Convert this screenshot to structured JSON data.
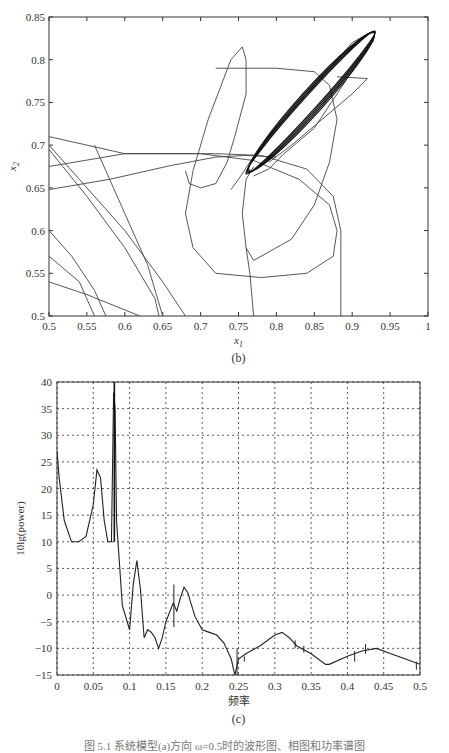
{
  "chart_data": [
    {
      "type": "line",
      "panel": "(b)",
      "title": "",
      "xlabel": "x1",
      "ylabel": "x2",
      "xlim": [
        0.5,
        1
      ],
      "ylim": [
        0.5,
        0.85
      ],
      "xticks": [
        "0.5",
        "0.55",
        "0.6",
        "0.65",
        "0.7",
        "0.75",
        "0.8",
        "0.85",
        "0.9",
        "0.95",
        "1"
      ],
      "yticks": [
        "0.5",
        "0.55",
        "0.6",
        "0.65",
        "0.7",
        "0.75",
        "0.8",
        "0.85"
      ],
      "grid": false,
      "description": "phase-plane trajectory converging to an elongated limit cycle from (0.76,0.67) to (0.93,0.83)",
      "series": [
        {
          "name": "limit-cycle",
          "x": [
            0.76,
            0.78,
            0.82,
            0.86,
            0.9,
            0.925,
            0.93,
            0.92,
            0.89,
            0.85,
            0.8,
            0.77,
            0.76
          ],
          "y": [
            0.665,
            0.69,
            0.73,
            0.77,
            0.81,
            0.83,
            0.832,
            0.815,
            0.78,
            0.74,
            0.7,
            0.67,
            0.665
          ]
        },
        {
          "name": "transient-1",
          "x": [
            0.5,
            0.6,
            0.7,
            0.78,
            0.86,
            0.89,
            0.885,
            0.885
          ],
          "y": [
            0.71,
            0.69,
            0.69,
            0.688,
            0.66,
            0.62,
            0.56,
            0.5
          ]
        },
        {
          "name": "transient-2",
          "x": [
            0.5,
            0.65,
            0.74,
            0.8,
            0.87,
            0.89,
            0.87,
            0.8,
            0.72,
            0.68,
            0.69,
            0.73,
            0.76
          ],
          "y": [
            0.648,
            0.672,
            0.686,
            0.79,
            0.79,
            0.73,
            0.64,
            0.57,
            0.548,
            0.6,
            0.7,
            0.8,
            0.815
          ]
        }
      ]
    },
    {
      "type": "line",
      "panel": "(c)",
      "title": "",
      "xlabel": "频率",
      "ylabel": "10lg(power)",
      "xlim": [
        0,
        0.5
      ],
      "ylim": [
        -15,
        40
      ],
      "xticks": [
        "0",
        "0.05",
        "0.1",
        "0.15",
        "0.2",
        "0.25",
        "0.3",
        "0.35",
        "0.4",
        "0.45",
        "0.5"
      ],
      "yticks": [
        "-15",
        "-10",
        "-5",
        "0",
        "5",
        "10",
        "15",
        "20",
        "25",
        "30",
        "35",
        "40"
      ],
      "grid": true,
      "x": [
        0,
        0.003,
        0.01,
        0.02,
        0.03,
        0.04,
        0.05,
        0.055,
        0.06,
        0.065,
        0.07,
        0.075,
        0.078,
        0.08,
        0.082,
        0.085,
        0.09,
        0.1,
        0.105,
        0.11,
        0.115,
        0.12,
        0.125,
        0.13,
        0.135,
        0.14,
        0.145,
        0.15,
        0.16,
        0.165,
        0.17,
        0.175,
        0.18,
        0.19,
        0.2,
        0.21,
        0.22,
        0.23,
        0.24,
        0.245,
        0.25,
        0.26,
        0.28,
        0.3,
        0.31,
        0.32,
        0.33,
        0.35,
        0.37,
        0.375,
        0.4,
        0.42,
        0.44,
        0.46,
        0.48,
        0.5
      ],
      "values": [
        27,
        22,
        14,
        10,
        10,
        11,
        17,
        23.5,
        22,
        14,
        10,
        10,
        38,
        35,
        14,
        8,
        -2,
        -6.5,
        2,
        6.5,
        1,
        -8,
        -6.5,
        -7,
        -8,
        -10,
        -8,
        -5,
        -1.5,
        -3,
        -0.5,
        1.5,
        0.5,
        -4,
        -6.5,
        -7,
        -7.5,
        -9,
        -12,
        -15,
        -12,
        -11,
        -9.5,
        -7.5,
        -7,
        -8,
        -9.5,
        -11,
        -13,
        -13,
        -11.5,
        -10.5,
        -10,
        -11,
        -12,
        -13
      ]
    }
  ],
  "panels": {
    "b": {
      "label": "(b)",
      "xlabel": "x",
      "xlabel_sub": "1",
      "ylabel": "x",
      "ylabel_sub": "2"
    },
    "c": {
      "label": "(c)",
      "xlabel": "频率",
      "ylabel": "10lg(power)"
    }
  },
  "caption": "图 5.1  系统模型(a)方向 ω=0.5时的波形图、相图和功率谱图"
}
